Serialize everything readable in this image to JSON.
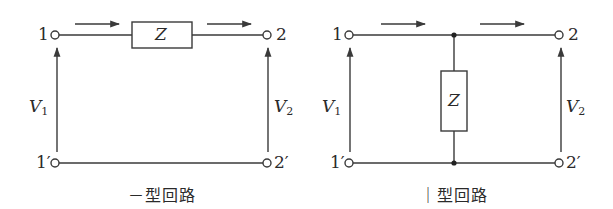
{
  "figure": {
    "colors": {
      "stroke": "#3a3a3a",
      "text": "#2a2a2a",
      "background": "#ffffff"
    },
    "circuits": [
      {
        "id": "series",
        "caption": "－型回路",
        "impedance_label": "Z",
        "impedance_orientation": "series (horizontal in top wire)",
        "terminals": {
          "in_top": "1",
          "in_bottom": "1′",
          "out_top": "2",
          "out_bottom": "2′"
        },
        "voltages": {
          "input": {
            "symbol": "V",
            "subscript": "1"
          },
          "output": {
            "symbol": "V",
            "subscript": "2"
          }
        },
        "current_arrows": 2
      },
      {
        "id": "shunt",
        "caption": "｜型回路",
        "impedance_label": "Z",
        "impedance_orientation": "shunt (vertical between top and bottom wires)",
        "terminals": {
          "in_top": "1",
          "in_bottom": "1′",
          "out_top": "2",
          "out_bottom": "2′"
        },
        "voltages": {
          "input": {
            "symbol": "V",
            "subscript": "1"
          },
          "output": {
            "symbol": "V",
            "subscript": "2"
          }
        },
        "current_arrows": 2
      }
    ]
  }
}
